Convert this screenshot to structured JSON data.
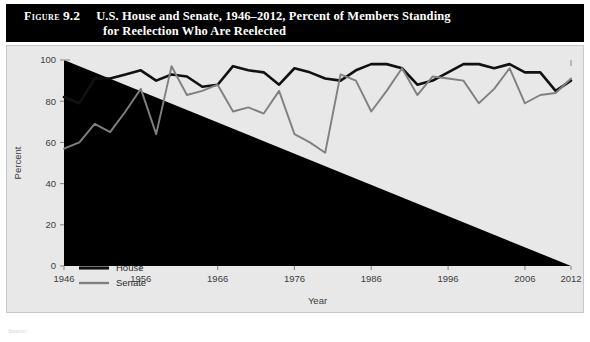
{
  "figure": {
    "label": "Figure",
    "number": "9.2",
    "title_line1": "U.S. House and Senate, 1946–2012, Percent of Members Standing",
    "title_line2": "for Reelection Who Are Reelected",
    "source_note": "Source:"
  },
  "colors": {
    "title_bar_bg": "#000000",
    "title_bar_text": "#ffffff",
    "panel_bg": "#e8e8e8",
    "panel_border": "#c8c8c8",
    "house_line": "#111111",
    "senate_line": "#808080",
    "axis": "#8c8c8c",
    "tick_text": "#3c3c3c"
  },
  "legend": {
    "position": "inside-bottom-left",
    "entries": [
      {
        "label": "House",
        "color": "#111111"
      },
      {
        "label": "Senate",
        "color": "#808080"
      }
    ]
  },
  "chart_data": {
    "type": "line",
    "title": "U.S. House and Senate, 1946–2012, Percent of Members Standing for Reelection Who Are Reelected",
    "xlabel": "Year",
    "ylabel": "Percent",
    "xlim": [
      1946,
      2012
    ],
    "ylim": [
      0,
      100
    ],
    "yticks": [
      0,
      20,
      40,
      60,
      80,
      100
    ],
    "xticks": [
      1946,
      1956,
      1966,
      1976,
      1986,
      1996,
      2006,
      2012
    ],
    "xtick_labels": [
      "1946",
      "1956",
      "1966",
      "1976",
      "1986",
      "1996",
      "2006",
      "2012"
    ],
    "ytick_labels": [
      "0",
      "20",
      "40",
      "60",
      "80",
      "100"
    ],
    "grid": false,
    "x": [
      1946,
      1948,
      1950,
      1952,
      1954,
      1956,
      1958,
      1960,
      1962,
      1964,
      1966,
      1968,
      1970,
      1972,
      1974,
      1976,
      1978,
      1980,
      1982,
      1984,
      1986,
      1988,
      1990,
      1992,
      1994,
      1996,
      1998,
      2000,
      2002,
      2004,
      2006,
      2008,
      2010,
      2012
    ],
    "series": [
      {
        "name": "House",
        "color": "#111111",
        "values": [
          82,
          79,
          91,
          91,
          93,
          95,
          90,
          93,
          92,
          87,
          88,
          97,
          95,
          94,
          88,
          96,
          94,
          91,
          90,
          95,
          98,
          98,
          96,
          88,
          90,
          94,
          98,
          98,
          96,
          98,
          94,
          94,
          85,
          90
        ]
      },
      {
        "name": "Senate",
        "color": "#808080",
        "values": [
          57,
          60,
          69,
          65,
          75,
          86,
          64,
          97,
          83,
          85,
          88,
          75,
          77,
          74,
          85,
          64,
          60,
          55,
          93,
          90,
          75,
          85,
          96,
          83,
          92,
          91,
          90,
          79,
          86,
          96,
          79,
          83,
          84,
          91
        ]
      }
    ],
    "annotations": []
  }
}
